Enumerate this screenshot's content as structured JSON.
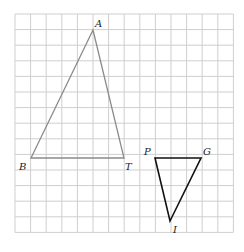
{
  "grid": {
    "columns": 14,
    "rows": 14,
    "origin_x": 15,
    "origin_y": 14,
    "cell": 15.6,
    "line_color": "#cfcfcf"
  },
  "triangles": [
    {
      "name": "ABT",
      "color": "#8a8a8a",
      "vertices": [
        {
          "label": "A",
          "x": 93,
          "y": 30
        },
        {
          "label": "B",
          "x": 31,
          "y": 158
        },
        {
          "label": "T",
          "x": 124,
          "y": 158
        }
      ]
    },
    {
      "name": "PGI",
      "color": "#111111",
      "vertices": [
        {
          "label": "P",
          "x": 155,
          "y": 158
        },
        {
          "label": "G",
          "x": 201,
          "y": 158
        },
        {
          "label": "I",
          "x": 170,
          "y": 221
        }
      ]
    }
  ],
  "labels": {
    "A": "A",
    "B": "B",
    "T": "T",
    "P": "P",
    "G": "G",
    "I": "I"
  }
}
